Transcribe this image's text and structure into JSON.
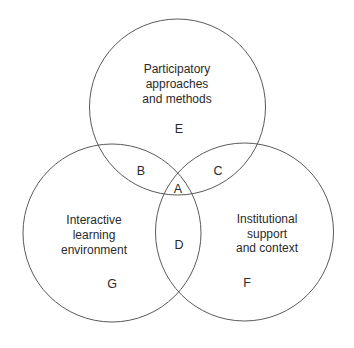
{
  "diagram": {
    "type": "venn-3",
    "stroke_color": "#5a5a5a",
    "text_color": "#2a2a2a",
    "sets": [
      {
        "id": "participatory",
        "region_letter": "E",
        "label_lines": [
          "Participatory",
          "approaches",
          "and methods"
        ],
        "position": "top"
      },
      {
        "id": "interactive",
        "region_letter": "G",
        "label_lines": [
          "Interactive",
          "learning",
          "environment"
        ],
        "position": "bottom-left"
      },
      {
        "id": "institutional",
        "region_letter": "F",
        "label_lines": [
          "Institutional",
          "support",
          "and context"
        ],
        "position": "bottom-right"
      }
    ],
    "intersections": [
      {
        "letter": "B",
        "sets": [
          "participatory",
          "interactive"
        ]
      },
      {
        "letter": "C",
        "sets": [
          "participatory",
          "institutional"
        ]
      },
      {
        "letter": "D",
        "sets": [
          "interactive",
          "institutional"
        ]
      },
      {
        "letter": "A",
        "sets": [
          "participatory",
          "interactive",
          "institutional"
        ]
      }
    ]
  }
}
